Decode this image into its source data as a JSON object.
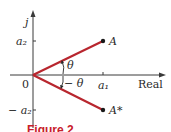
{
  "figure": {
    "caption": "Figure 2",
    "axes": {
      "vertical_label": "j",
      "horizontal_label": "Real",
      "origin_label": "0"
    },
    "ticks": {
      "x": [
        {
          "label": "a₁"
        }
      ],
      "y": [
        {
          "label": "a₂"
        },
        {
          "label": "− a₂"
        }
      ]
    },
    "points": [
      {
        "label": "A",
        "x": "a1",
        "y": "a2"
      },
      {
        "label": "A*",
        "x": "a1",
        "y": "-a2"
      }
    ],
    "angles": [
      {
        "label": "θ"
      },
      {
        "label": "− θ"
      }
    ],
    "colors": {
      "vector": "#b8262e",
      "axis": "#3a3a3a",
      "caption": "#c8202a"
    }
  }
}
